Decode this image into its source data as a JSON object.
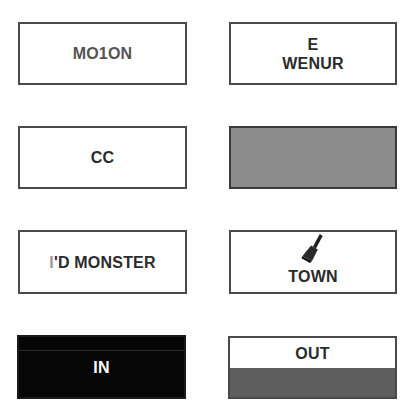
{
  "cards": [
    {
      "id": "motion",
      "label": "MO1ON",
      "style": "white"
    },
    {
      "id": "e-wenur",
      "label_line1": "E",
      "label_line2": "WENUR",
      "style": "white"
    },
    {
      "id": "cc",
      "label": "CC",
      "style": "white"
    },
    {
      "id": "grey-blank",
      "label": "",
      "style": "grey",
      "fill_color": "#8c8c8c"
    },
    {
      "id": "monster",
      "label_prefix": "I",
      "label": "'D MONSTER",
      "style": "white"
    },
    {
      "id": "town",
      "label": "TOWN",
      "icon": "paint-brush-icon",
      "style": "white"
    },
    {
      "id": "in",
      "label": "IN",
      "style": "black",
      "fill_color": "#060606"
    },
    {
      "id": "out",
      "label": "OUT",
      "style": "split",
      "fill_color": "#5e5e5e"
    }
  ]
}
